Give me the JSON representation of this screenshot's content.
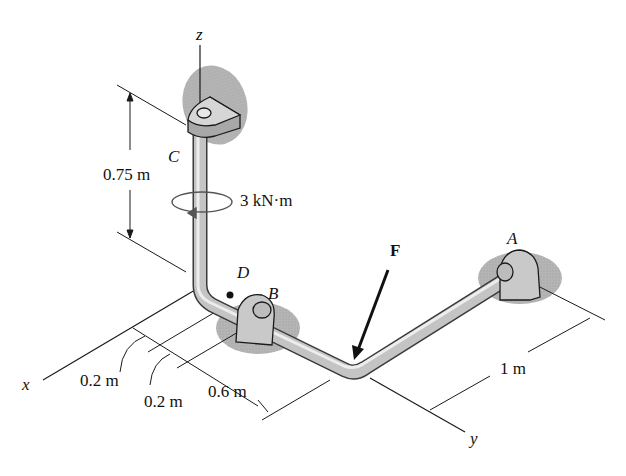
{
  "diagram": {
    "type": "3D statics pipe assembly",
    "axes": {
      "z": "z",
      "x": "x",
      "y": "y"
    },
    "points": {
      "C": "C",
      "D": "D",
      "B": "B",
      "A": "A"
    },
    "force": {
      "label": "F"
    },
    "couple_moment": {
      "label": "3 kN·m"
    },
    "dimensions": {
      "height_CD": "0.75 m",
      "x1": "0.2 m",
      "x2": "0.2 m",
      "x3": "0.6 m",
      "y1": "1 m"
    },
    "colors": {
      "pipe": "#b8b8b8",
      "pipe_dark": "#6d6d6d",
      "support_shadow": "#a9a9a9",
      "line": "#1a1a1a"
    }
  }
}
